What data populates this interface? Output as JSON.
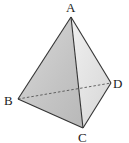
{
  "diagram": {
    "vertices": {
      "A": {
        "label": "A",
        "x": 71,
        "y": 17
      },
      "B": {
        "label": "B",
        "x": 18,
        "y": 99
      },
      "C": {
        "label": "C",
        "x": 83,
        "y": 128
      },
      "D": {
        "label": "D",
        "x": 111,
        "y": 83
      }
    },
    "solid_edges": [
      "AB",
      "AC",
      "AD",
      "BC",
      "CD"
    ],
    "hidden_edges": [
      "BD"
    ],
    "colors": {
      "edge": "#333333",
      "face_left": "#c8c8c8",
      "face_right": "#e4e4e4",
      "label": "#222222"
    }
  }
}
